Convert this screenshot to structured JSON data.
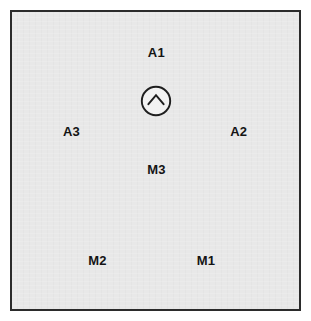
{
  "diagram": {
    "kind": "site-plan-node-map",
    "plate": {
      "fill_color": "#e8e8e8",
      "border_color": "#2b2b2b",
      "page_background": "#ffffff"
    },
    "north_marker": {
      "icon": "chevron-up-in-circle-icon",
      "meaning": "north-orientation-indicator",
      "stroke_color": "#1e1e1e",
      "fill_color": "#f2f2f2",
      "center_x_pct": 50.3,
      "center_y_pct": 29.8
    },
    "labels": [
      {
        "id": "A1",
        "text": "A1",
        "x_pct": 50.3,
        "y_pct": 13.3,
        "group": "A"
      },
      {
        "id": "A3",
        "text": "A3",
        "x_pct": 20.7,
        "y_pct": 40.2,
        "group": "A"
      },
      {
        "id": "A2",
        "text": "A2",
        "x_pct": 79.0,
        "y_pct": 40.2,
        "group": "A"
      },
      {
        "id": "M3",
        "text": "M3",
        "x_pct": 50.3,
        "y_pct": 52.8,
        "group": "M"
      },
      {
        "id": "M2",
        "text": "M2",
        "x_pct": 29.8,
        "y_pct": 83.4,
        "group": "M"
      },
      {
        "id": "M1",
        "text": "M1",
        "x_pct": 67.6,
        "y_pct": 83.4,
        "group": "M"
      }
    ]
  }
}
